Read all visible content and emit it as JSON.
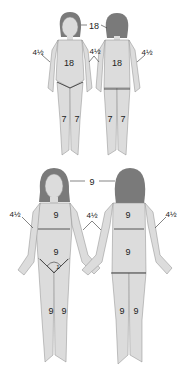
{
  "diagram": {
    "colors": {
      "skin": "#dcdcdc",
      "outline": "#8a8a8a",
      "hair": "#7a7a7a",
      "line": "#333333",
      "text": "#222222"
    },
    "child": {
      "head": "18",
      "arm_front": "4½",
      "arm_middle": "4½",
      "arm_back": "4½",
      "torso_front": "18",
      "torso_back": "18",
      "legs_front": [
        "7",
        "7"
      ],
      "legs_back": [
        "7",
        "7"
      ]
    },
    "adult": {
      "head": "9",
      "arm_front": "4½",
      "arm_middle": "4½",
      "arm_back": "4½",
      "chest": "9",
      "abdomen": "9",
      "perineum": "1",
      "upper_back": "9",
      "lower_back": "9",
      "legs_front": [
        "9",
        "9"
      ],
      "legs_back": [
        "9",
        "9"
      ]
    }
  }
}
